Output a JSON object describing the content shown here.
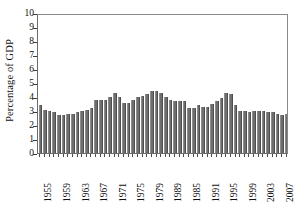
{
  "chart_data": {
    "type": "bar",
    "title": "",
    "subtitle": "",
    "xlabel": "",
    "ylabel": "Percentage of GDP",
    "ylim": [
      0,
      10
    ],
    "ytick_values": [
      0,
      1,
      2,
      3,
      4,
      5,
      6,
      7,
      8,
      9,
      10
    ],
    "ytick_labels": [
      "0",
      "1",
      "2",
      "3",
      "4",
      "5",
      "6",
      "7",
      "8",
      "9",
      "10"
    ],
    "grid": false,
    "legend": null,
    "legend_position": "none",
    "bar_color": "#6e6e6e",
    "frame_color": "#6b6b6b",
    "xtick_label_rotation": 90,
    "xtick_label_interval": 4,
    "xtick_labels_shown": [
      "1955",
      "1959",
      "1963",
      "1967",
      "1971",
      "1975",
      "1979",
      "1989",
      "1985",
      "1991",
      "1995",
      "1999",
      "2003",
      "2007"
    ],
    "categories": [
      "1955",
      "1956",
      "1957",
      "1958",
      "1959",
      "1960",
      "1961",
      "1962",
      "1963",
      "1964",
      "1965",
      "1966",
      "1967",
      "1968",
      "1969",
      "1970",
      "1971",
      "1972",
      "1973",
      "1974",
      "1975",
      "1976",
      "1977",
      "1978",
      "1979",
      "1980",
      "1981",
      "1982",
      "1983",
      "1984",
      "1985",
      "1986",
      "1987",
      "1988",
      "1989",
      "1990",
      "1991",
      "1992",
      "1993",
      "1994",
      "1995",
      "1996",
      "1997",
      "1998",
      "1999",
      "2000",
      "2001",
      "2002",
      "2003",
      "2004",
      "2005",
      "2006",
      "2007",
      "2008"
    ],
    "values": [
      3.4,
      3.1,
      3.0,
      2.9,
      2.7,
      2.7,
      2.8,
      2.8,
      2.9,
      3.0,
      3.1,
      3.2,
      3.8,
      3.8,
      3.8,
      4.0,
      4.3,
      4.0,
      3.6,
      3.6,
      3.8,
      4.0,
      4.1,
      4.2,
      4.4,
      4.4,
      4.3,
      4.0,
      3.8,
      3.7,
      3.7,
      3.7,
      3.2,
      3.2,
      3.4,
      3.3,
      3.3,
      3.5,
      3.7,
      3.9,
      4.3,
      4.2,
      3.4,
      3.0,
      3.0,
      2.9,
      3.0,
      3.0,
      3.0,
      2.9,
      2.9,
      2.8,
      2.7,
      2.8
    ]
  }
}
